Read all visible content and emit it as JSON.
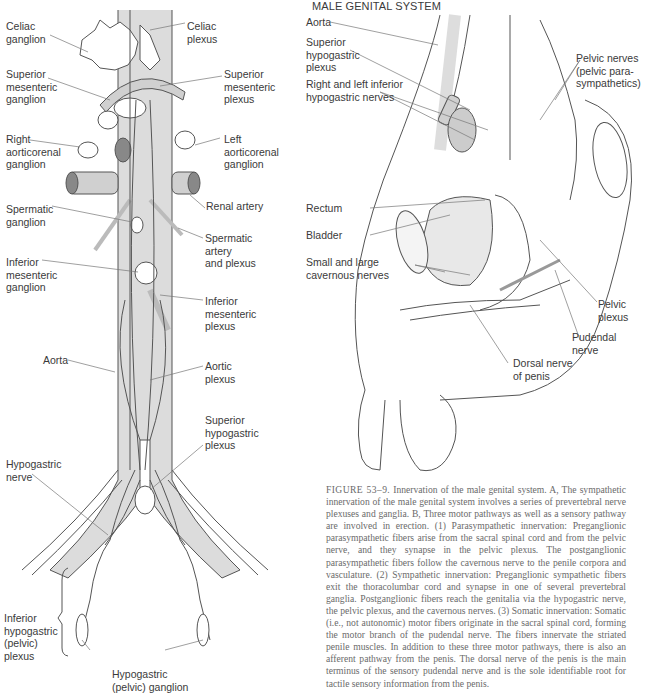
{
  "panel_b": {
    "title": "MALE GENITAL SYSTEM",
    "labels": {
      "aorta": "Aorta",
      "superior_hypogastric_plexus": "Superior\nhypogastric\nplexus",
      "inferior_hypogastric_nerves": "Right and left inferior\nhypogastric nerves",
      "pelvic_nerves": "Pelvic nerves\n(pelvic para-\nsympathetics)",
      "rectum": "Rectum",
      "bladder": "Bladder",
      "cavernous_nerves": "Small and large\ncavernous nerves",
      "pelvic_plexus": "Pelvic\nplexus",
      "pudendal_nerve": "Pudendal\nnerve",
      "dorsal_nerve": "Dorsal nerve\nof penis"
    }
  },
  "panel_a": {
    "labels": {
      "celiac_ganglion": "Celiac\nganglion",
      "celiac_plexus": "Celiac\nplexus",
      "superior_mesenteric_ganglion": "Superior\nmesenteric\nganglion",
      "superior_mesenteric_plexus": "Superior\nmesenteric\nplexus",
      "right_aorticorenal_ganglion": "Right\naorticorenal\nganglion",
      "left_aorticorenal_ganglion": "Left\naorticorenal\nganglion",
      "renal_artery": "Renal artery",
      "spermatic_ganglion": "Spermatic\nganglion",
      "spermatic_artery": "Spermatic\nartery\nand plexus",
      "inferior_mesenteric_ganglion": "Inferior\nmesenteric\nganglion",
      "inferior_mesenteric_plexus": "Inferior\nmesenteric\nplexus",
      "aorta": "Aorta",
      "aortic_plexus": "Aortic\nplexus",
      "superior_hypogastric_plexus": "Superior\nhypogastric\nplexus",
      "hypogastric_nerve": "Hypogastric\nnerve",
      "inferior_hypogastric_plexus": "Inferior\nhypogastric\n(pelvic)\nplexus",
      "hypogastric_ganglion": "Hypogastric\n(pelvic) ganglion"
    }
  },
  "caption": {
    "figure_number": "FIGURE 53–9.",
    "text": " Innervation of the male genital system. A, The sympathetic innervation of the male genital system involves a series of prevertebral nerve plexuses and ganglia. B, Three motor pathways as well as a sensory pathway are involved in erection. (1) Parasympathetic innervation: Preganglionic parasympathetic fibers arise from the sacral spinal cord and from the pelvic nerve, and they synapse in the pelvic plexus. The postganglionic parasympathetic fibers follow the cavernous nerve to the penile corpora and vasculature. (2) Sympathetic innervation: Preganglionic sympathetic fibers exit the thoracolumbar cord and synapse in one of several prevertebral ganglia. Postganglionic fibers reach the genitalia via the hypogastric nerve, the pelvic plexus, and the cavernous nerves. (3) Somatic innervation: Somatic (i.e., not autonomic) motor fibers originate in the sacral spinal cord, forming the motor branch of the pudendal nerve. The fibers innervate the striated penile muscles. In addition to these three motor pathways, there is also an afferent pathway from the penis. The dorsal nerve of the penis is the main terminus of the sensory pudendal nerve and is the sole identifiable root for tactile sensory information from the penis."
  },
  "colors": {
    "vessel_fill": "#d9d9d9",
    "line": "#555555",
    "label_text": "#3a3a3a",
    "caption_text": "#6a6a6a"
  }
}
